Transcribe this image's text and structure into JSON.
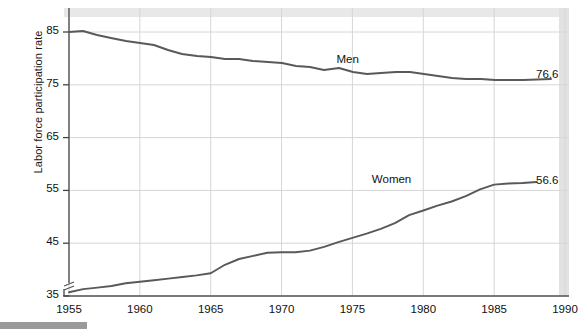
{
  "chart_data": {
    "type": "line",
    "title": "",
    "subtitle": "",
    "xlabel": "",
    "ylabel": "Labor force participation rate",
    "xlim": [
      1955,
      1990
    ],
    "ylim": [
      35,
      88
    ],
    "ytick_values": [
      35,
      45,
      55,
      65,
      75,
      85
    ],
    "ytick_labels": [
      "35",
      "45",
      "55",
      "65",
      "75",
      "85"
    ],
    "xtick_values": [
      1955,
      1960,
      1965,
      1970,
      1975,
      1980,
      1985,
      1990
    ],
    "xtick_labels": [
      "1955",
      "1960",
      "1965",
      "1970",
      "1975",
      "1980",
      "1985",
      "1990"
    ],
    "grid": true,
    "grid_axis": "both",
    "y_axis_break": true,
    "legend_position": "inline-annotation",
    "line_color": "#595959",
    "grid_color": "#d6d6d6",
    "axis_color": "#555555",
    "series": [
      {
        "name": "Men",
        "label": "Men",
        "label_x": 1975.0,
        "label_y": 79.6,
        "end_label": "76.6",
        "end_value": 76.6,
        "x": [
          1955,
          1956,
          1957,
          1958,
          1959,
          1960,
          1961,
          1962,
          1963,
          1964,
          1965,
          1966,
          1967,
          1968,
          1969,
          1970,
          1971,
          1972,
          1973,
          1974,
          1975,
          1976,
          1977,
          1978,
          1979,
          1980,
          1981,
          1982,
          1983,
          1984,
          1985,
          1986,
          1987,
          1988
        ],
        "values": [
          85.4,
          85.5,
          84.8,
          84.2,
          83.7,
          83.3,
          82.9,
          82.0,
          81.4,
          81.0,
          80.7,
          80.4,
          80.4,
          80.1,
          79.8,
          79.7,
          79.1,
          78.9,
          78.3,
          78.7,
          77.9,
          77.5,
          77.7,
          77.9,
          77.8,
          77.4,
          77.0,
          76.6,
          76.4,
          76.4,
          76.3,
          76.3,
          76.2,
          76.6
        ],
        "pixel_path": "69,32 83,31 97,35 111,38 126,41 140,43 154,45 168,50 182,54 197,56 211,57 225,59 239,59 253,61 268,62 282,63 296,66 310,67 324,70 339,68 353,72 367,74 381,73 396,72 410,72 424,74 438,76 452,78 466,79 481,79 495,80 509,80 523,80 551,79"
      },
      {
        "name": "Women",
        "label": "Women",
        "label_x": 1977.5,
        "label_y": 56.8,
        "end_label": "56.6",
        "end_value": 56.6,
        "x": [
          1955,
          1956,
          1957,
          1958,
          1959,
          1960,
          1961,
          1962,
          1963,
          1964,
          1965,
          1966,
          1967,
          1968,
          1969,
          1970,
          1971,
          1972,
          1973,
          1974,
          1975,
          1976,
          1977,
          1978,
          1979,
          1980,
          1981,
          1982,
          1983,
          1984,
          1985,
          1986,
          1987,
          1988
        ],
        "values": [
          35.7,
          36.3,
          36.6,
          36.9,
          37.4,
          37.7,
          38.0,
          38.3,
          38.6,
          38.9,
          39.3,
          40.9,
          42.0,
          42.6,
          43.2,
          43.3,
          43.3,
          43.6,
          44.3,
          45.2,
          46.0,
          46.8,
          47.7,
          48.8,
          50.3,
          51.2,
          52.1,
          52.9,
          53.9,
          55.2,
          56.1,
          56.3,
          56.4,
          56.6
        ]
      }
    ]
  },
  "artifacts": {
    "top_band_color": "#e8e8e8",
    "right_band_color": "#e2e2e2",
    "scan_bar_color": "#9a9a9a"
  }
}
